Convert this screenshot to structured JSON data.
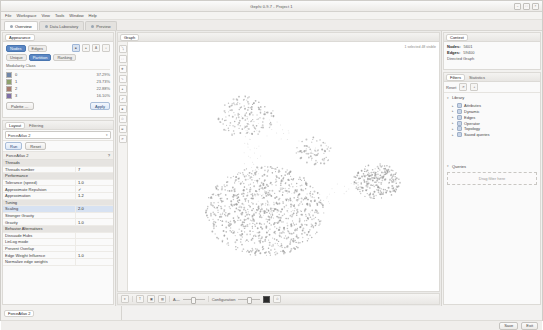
{
  "window": {
    "title": "Gephi 0.9.7 - Project 1",
    "buttons": [
      "–",
      "□",
      "×"
    ]
  },
  "menubar": [
    "File",
    "Workspace",
    "View",
    "Tools",
    "Window",
    "Help"
  ],
  "workspace_tabs": [
    {
      "label": "Overview",
      "active": true
    },
    {
      "label": "Data Laboratory",
      "active": false
    },
    {
      "label": "Preview",
      "active": false
    }
  ],
  "appearance": {
    "panel_tab": "Appearance",
    "target_segments": [
      {
        "label": "Nodes",
        "active": true
      },
      {
        "label": "Edges",
        "active": false
      }
    ],
    "mode_segments": [
      {
        "label": "Unique",
        "active": false
      },
      {
        "label": "Partition",
        "active": true
      },
      {
        "label": "Ranking",
        "active": false
      }
    ],
    "icon_buttons": [
      "color-icon",
      "size-icon",
      "label-color-icon",
      "label-size-icon"
    ],
    "attribute_label": "Modularity Class",
    "partition_header": "Partition",
    "partition_rows": [
      {
        "label": "0",
        "color": "#6f86a8",
        "pct": "37.29%"
      },
      {
        "label": "1",
        "color": "#8fa26d",
        "pct": "23.73%"
      },
      {
        "label": "2",
        "color": "#a87c6f",
        "pct": "22.88%"
      },
      {
        "label": "3",
        "color": "#7f6fa8",
        "pct": "16.10%"
      }
    ],
    "palette_label": "Palette …",
    "apply_label": "Apply"
  },
  "layout": {
    "panel_tabs": [
      {
        "label": "Layout",
        "active": true
      },
      {
        "label": "Filtering",
        "active": false
      }
    ],
    "selected_algorithm": "ForceAtlas 2",
    "run_label": "Run",
    "reset_label": "Reset",
    "properties_title": "ForceAtlas 2",
    "properties": [
      {
        "group": "Threads"
      },
      {
        "name": "Threads number",
        "value": "7"
      },
      {
        "group": "Performance"
      },
      {
        "name": "Tolerance (speed)",
        "value": "1.0"
      },
      {
        "name": "Approximate Repulsion",
        "value": "✓"
      },
      {
        "name": "Approximation",
        "value": "1.2"
      },
      {
        "group": "Tuning"
      },
      {
        "name": "Scaling",
        "value": "2.0",
        "selected": true
      },
      {
        "name": "Stronger Gravity",
        "value": ""
      },
      {
        "name": "Gravity",
        "value": "1.0"
      },
      {
        "group": "Behavior Alternatives"
      },
      {
        "name": "Dissuade Hubs",
        "value": ""
      },
      {
        "name": "LinLog mode",
        "value": ""
      },
      {
        "name": "Prevent Overlap",
        "value": ""
      },
      {
        "name": "Edge Weight Influence",
        "value": "1.0"
      },
      {
        "name": "Normalize edge weights",
        "value": ""
      }
    ]
  },
  "bottom_left": {
    "tabs": [
      {
        "label": "Layout",
        "active": true
      },
      {
        "label": "Filters",
        "active": false
      }
    ],
    "panel_label": "ForceAtlas 2"
  },
  "graph": {
    "panel_tab": "Graph",
    "toolbar_note": "Nodes: browse & inspect",
    "vtool_icons": [
      "cursor-icon",
      "rect-select-icon",
      "drag-icon",
      "paint-icon",
      "size-brush-icon",
      "shortest-path-icon",
      "edit-node-icon",
      "heatmap-icon",
      "center-icon",
      "reset-zoom-icon"
    ],
    "canvas_note": "1 selected\n48 visible",
    "bottom_toolbar": {
      "show_labels_icon": "label-icon",
      "font_icon": "T",
      "grid_icons": [
        "node-label-icon",
        "edge-label-icon"
      ],
      "size_slider_label": "A—",
      "attribute_label": "Configuration",
      "color_chip": "#2b2b2b",
      "screenshot_icon": "camera-icon"
    }
  },
  "context": {
    "panel_tab": "Context",
    "rows": [
      {
        "key": "Nodes:",
        "val": "5601"
      },
      {
        "key": "Edges:",
        "val": "59400"
      },
      {
        "key": "Directed Graph",
        "val": ""
      }
    ]
  },
  "filters": {
    "panel_tabs": [
      {
        "label": "Filters",
        "active": true
      },
      {
        "label": "Statistics",
        "active": false
      }
    ],
    "toolbar_label": "Reset",
    "library_label": "Library",
    "library_items": [
      "Attributes",
      "Dynamic",
      "Edges",
      "Operator",
      "Topology",
      "Saved queries"
    ],
    "queries_label": "Queries",
    "dropzone_label": "Drag filter here"
  },
  "statusbar": {
    "left": "",
    "right": [
      "Save",
      "Exit"
    ]
  },
  "chart_data": {
    "type": "scatter",
    "clusters": [
      {
        "cx": 0.44,
        "cy": 0.68,
        "r": 0.19,
        "n": 900,
        "color": "#9e9e9e"
      },
      {
        "cx": 0.8,
        "cy": 0.56,
        "r": 0.075,
        "n": 230,
        "color": "#9a9a9a"
      },
      {
        "cx": 0.38,
        "cy": 0.3,
        "r": 0.09,
        "n": 150,
        "color": "#a3a3a3"
      },
      {
        "cx": 0.6,
        "cy": 0.44,
        "r": 0.06,
        "n": 70,
        "color": "#a6a6a6"
      }
    ],
    "bridges": [
      {
        "x1": 0.44,
        "y1": 0.68,
        "x2": 0.8,
        "y2": 0.56,
        "n": 60
      },
      {
        "x1": 0.44,
        "y1": 0.68,
        "x2": 0.38,
        "y2": 0.3,
        "n": 70
      },
      {
        "x1": 0.38,
        "y1": 0.3,
        "x2": 0.6,
        "y2": 0.44,
        "n": 30
      }
    ]
  }
}
